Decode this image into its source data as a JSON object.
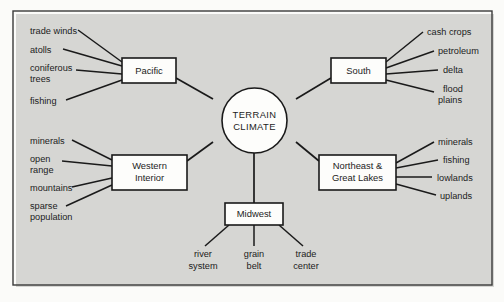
{
  "diagram": {
    "type": "spider-web-concept-map",
    "center": {
      "line1": "TERRAIN",
      "line2": "CLIMATE"
    },
    "branches": [
      {
        "id": "pacific",
        "label_line1": "Pacific",
        "label_line2": "",
        "position": "upper-left",
        "leaves": [
          "trade winds",
          "atolls",
          "coniferous trees",
          "fishing"
        ]
      },
      {
        "id": "south",
        "label_line1": "South",
        "label_line2": "",
        "position": "upper-right",
        "leaves": [
          "cash crops",
          "petroleum",
          "delta",
          "flood plains"
        ]
      },
      {
        "id": "western-interior",
        "label_line1": "Western",
        "label_line2": "Interior",
        "position": "lower-left",
        "leaves": [
          "minerals",
          "open range",
          "mountains",
          "sparse population"
        ]
      },
      {
        "id": "northeast-great-lakes",
        "label_line1": "Northeast &",
        "label_line2": "Great Lakes",
        "position": "lower-right",
        "leaves": [
          "minerals",
          "fishing",
          "lowlands",
          "uplands"
        ]
      },
      {
        "id": "midwest",
        "label_line1": "Midwest",
        "label_line2": "",
        "position": "bottom",
        "leaves": [
          "river system",
          "grain belt",
          "trade center"
        ]
      }
    ],
    "leaf_labels": {
      "pacific": [
        {
          "line1": "trade winds",
          "line2": ""
        },
        {
          "line1": "atolls",
          "line2": ""
        },
        {
          "line1": "coniferous",
          "line2": "trees"
        },
        {
          "line1": "fishing",
          "line2": ""
        }
      ],
      "south": [
        {
          "line1": "cash crops",
          "line2": ""
        },
        {
          "line1": "petroleum",
          "line2": ""
        },
        {
          "line1": "delta",
          "line2": ""
        },
        {
          "line1": "flood",
          "line2": "plains"
        }
      ],
      "western_interior": [
        {
          "line1": "minerals",
          "line2": ""
        },
        {
          "line1": "open",
          "line2": "range"
        },
        {
          "line1": "mountains",
          "line2": ""
        },
        {
          "line1": "sparse",
          "line2": "population"
        }
      ],
      "northeast": [
        {
          "line1": "minerals",
          "line2": ""
        },
        {
          "line1": "fishing",
          "line2": ""
        },
        {
          "line1": "lowlands",
          "line2": ""
        },
        {
          "line1": "uplands",
          "line2": ""
        }
      ],
      "midwest": [
        {
          "line1": "river",
          "line2": "system"
        },
        {
          "line1": "grain",
          "line2": "belt"
        },
        {
          "line1": "trade",
          "line2": "center"
        }
      ]
    }
  },
  "colors": {
    "ink": "#1a1a1a",
    "frame": "#3a3a3a",
    "paper": "#fbfbf9",
    "node_fill": "#fdfdfb"
  }
}
